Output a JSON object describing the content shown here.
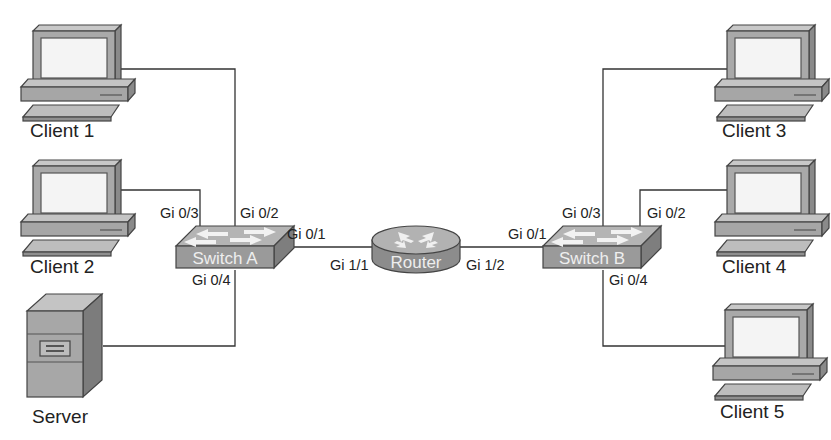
{
  "diagram": {
    "type": "network-topology",
    "devices": {
      "client1": {
        "label": "Client 1",
        "type": "workstation"
      },
      "client2": {
        "label": "Client 2",
        "type": "workstation"
      },
      "server": {
        "label": "Server",
        "type": "server"
      },
      "switch_a": {
        "label": "Switch A",
        "type": "switch"
      },
      "router": {
        "label": "Router",
        "type": "router"
      },
      "switch_b": {
        "label": "Switch B",
        "type": "switch"
      },
      "client3": {
        "label": "Client 3",
        "type": "workstation"
      },
      "client4": {
        "label": "Client 4",
        "type": "workstation"
      },
      "client5": {
        "label": "Client 5",
        "type": "workstation"
      }
    },
    "ports": {
      "switch_a_gi03": "Gi 0/3",
      "switch_a_gi02": "Gi 0/2",
      "switch_a_gi01": "Gi 0/1",
      "switch_a_gi04": "Gi 0/4",
      "router_gi11": "Gi 1/1",
      "router_gi12": "Gi 1/2",
      "switch_b_gi01": "Gi 0/1",
      "switch_b_gi03": "Gi 0/3",
      "switch_b_gi02": "Gi 0/2",
      "switch_b_gi04": "Gi 0/4"
    },
    "links": [
      {
        "from": "Client 1",
        "to": "Switch A",
        "port": "Gi 0/2"
      },
      {
        "from": "Client 2",
        "to": "Switch A",
        "port": "Gi 0/3"
      },
      {
        "from": "Server",
        "to": "Switch A",
        "port": "Gi 0/4"
      },
      {
        "from": "Switch A",
        "port_a": "Gi 0/1",
        "to": "Router",
        "port_b": "Gi 1/1"
      },
      {
        "from": "Router",
        "port_a": "Gi 1/2",
        "to": "Switch B",
        "port_b": "Gi 0/1"
      },
      {
        "from": "Client 3",
        "to": "Switch B",
        "port": "Gi 0/3"
      },
      {
        "from": "Client 4",
        "to": "Switch B",
        "port": "Gi 0/2"
      },
      {
        "from": "Client 5",
        "to": "Switch B",
        "port": "Gi 0/4"
      }
    ]
  },
  "colors": {
    "device_fill": "#a8a8a8",
    "device_dark": "#7a7a7a",
    "device_light": "#c4c4c4",
    "screen": "#f2f2f2",
    "wire": "#333333"
  }
}
